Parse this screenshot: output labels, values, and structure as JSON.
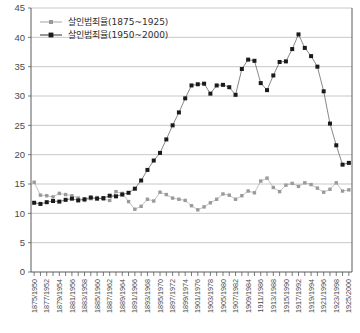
{
  "chart_data": {
    "type": "line",
    "title": "",
    "xlabel": "",
    "ylabel": "",
    "ylim": [
      0,
      45
    ],
    "ytick_step": 5,
    "yticks": [
      0,
      5,
      10,
      15,
      20,
      25,
      30,
      35,
      40,
      45
    ],
    "grid": true,
    "legend_position": "top-left",
    "categories": [
      "1875/1950",
      "1876/1951",
      "1877/1952",
      "1878/1953",
      "1879/1954",
      "1880/1955",
      "1881/1956",
      "1882/1957",
      "1883/1958",
      "1884/1959",
      "1885/1960",
      "1886/1961",
      "1887/1962",
      "1888/1963",
      "1889/1964",
      "1890/1965",
      "1891/1966",
      "1892/1967",
      "1893/1968",
      "1894/1969",
      "1895/1970",
      "1896/1971",
      "1897/1972",
      "1898/1973",
      "1899/1974",
      "1900/1975",
      "1901/1976",
      "1902/1977",
      "1903/1978",
      "1904/1979",
      "1905/1980",
      "1906/1981",
      "1907/1982",
      "1908/1983",
      "1909/1984",
      "1910/1985",
      "1911/1986",
      "1912/1987",
      "1913/1988",
      "1914/1989",
      "1915/1990",
      "1916/1991",
      "1917/1992",
      "1918/1993",
      "1919/1994",
      "1920/1995",
      "1921/1996",
      "1922/1997",
      "1923/1998",
      "1924/1999",
      "1925/2000"
    ],
    "xtick_labels_shown": [
      "1875/1950",
      "1877/1952",
      "1879/1954",
      "1881/1956",
      "1883/1958",
      "1885/1960",
      "1887/1962",
      "1889/1964",
      "1891/1966",
      "1893/1968",
      "1895/1970",
      "1897/1972",
      "1899/1974",
      "1901/1976",
      "1903/1978",
      "1905/1980",
      "1907/1982",
      "1909/1984",
      "1911/1986",
      "1913/1988",
      "1915/1990",
      "1917/1992",
      "1919/1994",
      "1921/1996",
      "1923/1998",
      "1925/2000"
    ],
    "series": [
      {
        "name": "살인범죄율(1875~1925)",
        "marker": "square",
        "color": "#9a9a9a",
        "values": [
          15.3,
          13.1,
          13.0,
          12.8,
          13.4,
          13.2,
          13.0,
          12.6,
          12.2,
          12.5,
          12.7,
          12.4,
          12.2,
          13.7,
          13.4,
          12.0,
          10.7,
          11.2,
          12.4,
          12.1,
          13.6,
          13.2,
          12.6,
          12.4,
          12.2,
          11.3,
          10.6,
          11.1,
          11.8,
          12.4,
          13.3,
          13.1,
          12.4,
          13.0,
          13.8,
          13.5,
          15.5,
          16.0,
          14.4,
          13.7,
          14.8,
          15.1,
          14.6,
          15.2,
          14.9,
          14.3,
          13.6,
          14.1,
          15.2,
          13.8,
          14.0
        ]
      },
      {
        "name": "살인범죄율(1950~2000)",
        "marker": "square",
        "color": "#1a1a1a",
        "values": [
          11.8,
          11.6,
          11.9,
          12.1,
          12.0,
          12.3,
          12.5,
          12.2,
          12.4,
          12.7,
          12.5,
          12.6,
          13.0,
          12.9,
          13.2,
          13.5,
          14.2,
          15.6,
          17.4,
          19.0,
          20.3,
          22.6,
          25.0,
          27.2,
          29.6,
          31.8,
          32.0,
          32.1,
          30.4,
          31.8,
          31.9,
          31.5,
          30.2,
          34.6,
          36.2,
          36.0,
          32.2,
          31.0,
          33.5,
          35.8,
          35.9,
          38.0,
          40.5,
          38.2,
          36.8,
          35.0,
          30.8,
          25.3,
          21.6,
          18.3,
          18.6
        ]
      }
    ]
  },
  "legend": {
    "entries": [
      {
        "label": "살인범죄율(1875~1925)",
        "swatch_color": "#9a9a9a"
      },
      {
        "label": "살인범죄율(1950~2000)",
        "swatch_color": "#1a1a1a"
      }
    ]
  },
  "colors": {
    "series_a": "#9a9a9a",
    "series_b": "#1a1a1a",
    "grid": "#b9b9b9",
    "axis": "#5a5a5a",
    "background": "#ffffff"
  }
}
